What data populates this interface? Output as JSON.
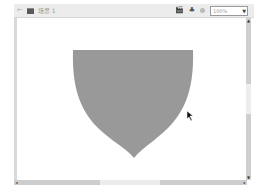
{
  "toolbar": {
    "back_icon": "←",
    "scene_label": "场景 1",
    "edit_symbols_icon": "🎬",
    "edit_scene_icon": "♣",
    "zoom_value": "100%",
    "zoom_arrow": "▼"
  },
  "stage": {
    "background": "#ffffff",
    "shape": {
      "type": "shield",
      "fill": "#999999"
    }
  },
  "scrollbars": {
    "up_arrow": "▲",
    "down_arrow": "▼",
    "left_arrow": "◂",
    "right_arrow": "▸"
  }
}
